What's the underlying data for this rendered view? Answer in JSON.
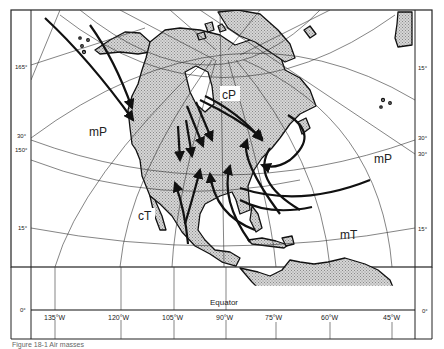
{
  "map": {
    "title": "Air masses of North America",
    "background_color": "#ffffff",
    "land_color": "#c8c8c8",
    "line_color": "#222222",
    "air_mass_labels": [
      {
        "id": "mP-west",
        "text": "mP",
        "x": 89,
        "y": 136
      },
      {
        "id": "cP",
        "text": "cP",
        "x": 229,
        "y": 99
      },
      {
        "id": "mP-east",
        "text": "mP",
        "x": 374,
        "y": 163
      },
      {
        "id": "cT",
        "text": "cT",
        "x": 140,
        "y": 219
      },
      {
        "id": "mT",
        "text": "mT",
        "x": 340,
        "y": 239
      }
    ],
    "equator_label": "Equator",
    "left_ticks": [
      {
        "text": "165°",
        "y": 67
      },
      {
        "text": "30°",
        "y": 136
      },
      {
        "text": "150°",
        "y": 150
      },
      {
        "text": "15°",
        "y": 228
      },
      {
        "text": "0°",
        "y": 310
      }
    ],
    "right_ticks": [
      {
        "text": "15°",
        "y": 68
      },
      {
        "text": "30°",
        "y": 138
      },
      {
        "text": "30°",
        "y": 154
      },
      {
        "text": "15°",
        "y": 229
      },
      {
        "text": "0°",
        "y": 311
      }
    ],
    "longitude_labels": [
      {
        "text": "135°W",
        "x": 59
      },
      {
        "text": "120°W",
        "x": 121
      },
      {
        "text": "105°W",
        "x": 174
      },
      {
        "text": "90°W",
        "x": 224
      },
      {
        "text": "75°W",
        "x": 276
      },
      {
        "text": "60°W",
        "x": 330
      },
      {
        "text": "45°W",
        "x": 393
      }
    ],
    "caption": "Figure 18-1  Air masses"
  }
}
